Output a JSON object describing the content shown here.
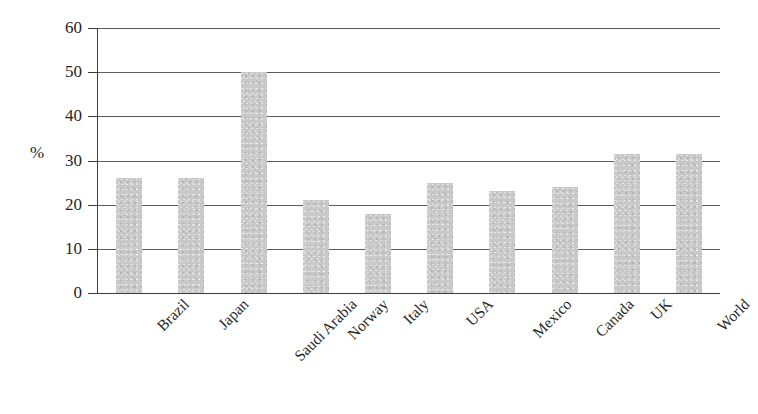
{
  "chart_data": {
    "type": "bar",
    "title": "",
    "subtitle": "",
    "xlabel": "",
    "ylabel": "%",
    "ylim": [
      0,
      60
    ],
    "ytick_values": [
      60,
      50,
      40,
      30,
      20,
      10,
      0
    ],
    "ytick_labels": [
      "60",
      "50",
      "40",
      "30",
      "20",
      "10",
      "0"
    ],
    "grid": true,
    "grid_axis": "y",
    "legend": false,
    "legend_position": "none",
    "categories": [
      "Brazil",
      "Japan",
      "Saudi Arabia",
      "Norway",
      "Italy",
      "USA",
      "Mexico",
      "Canada",
      "UK",
      "World"
    ],
    "values": [
      26,
      26,
      50,
      21,
      18,
      25,
      23,
      24,
      31.5,
      31.5
    ],
    "series": [
      {
        "name": "",
        "values": [
          26,
          26,
          50,
          21,
          18,
          25,
          23,
          24,
          31.5,
          31.5
        ]
      }
    ],
    "bar_color": "#c9c9c9",
    "axis_color": "#3d3d3d",
    "gridline_color": "#5c5c5c",
    "background_color": "#ffffff",
    "xtick_rotation": -45
  }
}
